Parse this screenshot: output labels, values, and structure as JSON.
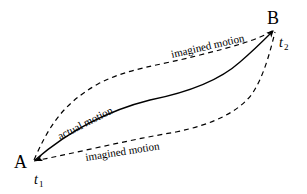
{
  "diagram": {
    "points": {
      "start": {
        "label": "A",
        "time": "t",
        "time_sub": "1"
      },
      "end": {
        "label": "B",
        "time": "t",
        "time_sub": "2"
      }
    },
    "paths": {
      "actual": {
        "label": "actual motion",
        "style": "solid",
        "arrow": "end"
      },
      "imagined_upper": {
        "label": "imagined motion",
        "style": "dashed"
      },
      "imagined_lower": {
        "label": "imagined motion",
        "style": "dashed"
      }
    },
    "colors": {
      "stroke": "#000000",
      "background": "#ffffff"
    }
  }
}
